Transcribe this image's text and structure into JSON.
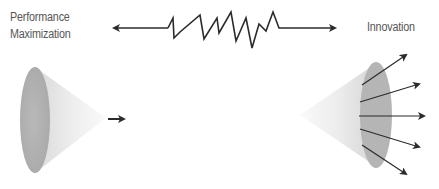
{
  "diagram": {
    "left_label_line1": "Performance",
    "left_label_line2": "Maximization",
    "right_label": "Innovation",
    "connector": "double-headed arrow with zig-zag tension in the middle",
    "left_shape": "cone with single forward arrow",
    "right_shape": "cone with five diverging arrows",
    "colors": {
      "line": "#2b2b2b",
      "cone_light": "#f4f4f4",
      "cone_dark": "#bdbdbd",
      "text": "#555555"
    }
  }
}
